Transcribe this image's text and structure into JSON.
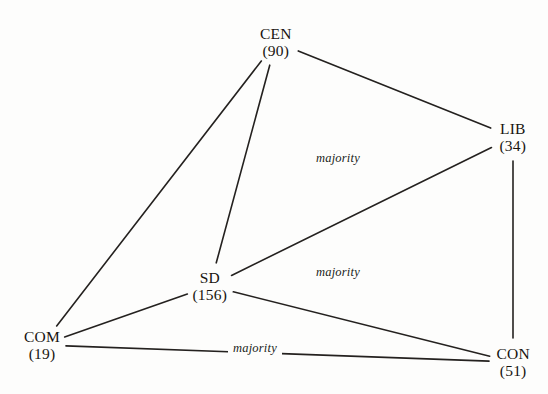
{
  "diagram": {
    "type": "coalition-graph",
    "background_color": "#fdfdfc",
    "line_color": "#24211f",
    "text_color": "#17140f",
    "nodes": [
      {
        "id": "CEN",
        "name": "CEN",
        "count": "(90)",
        "value": 90,
        "x": 276,
        "y": 42
      },
      {
        "id": "LIB",
        "name": "LIB",
        "count": "(34)",
        "value": 34,
        "x": 513,
        "y": 137
      },
      {
        "id": "SD",
        "name": "SD",
        "count": "(156)",
        "value": 156,
        "x": 210,
        "y": 286
      },
      {
        "id": "COM",
        "name": "COM",
        "count": "(19)",
        "value": 19,
        "x": 42,
        "y": 345
      },
      {
        "id": "CON",
        "name": "CON",
        "count": "(51)",
        "value": 51,
        "x": 513,
        "y": 362
      }
    ],
    "edges": [
      {
        "id": "cen-lib",
        "from": "CEN",
        "to": "LIB"
      },
      {
        "id": "cen-com",
        "from": "CEN",
        "to": "COM"
      },
      {
        "id": "cen-sd",
        "from": "CEN",
        "to": "SD"
      },
      {
        "id": "lib-sd",
        "from": "LIB",
        "to": "SD"
      },
      {
        "id": "lib-con",
        "from": "LIB",
        "to": "CON"
      },
      {
        "id": "sd-com",
        "from": "SD",
        "to": "COM"
      },
      {
        "id": "sd-con",
        "from": "SD",
        "to": "CON"
      },
      {
        "id": "com-con",
        "from": "COM",
        "to": "CON"
      }
    ],
    "annotations": [
      {
        "id": "majority-upper",
        "label": "majority",
        "x": 338,
        "y": 158,
        "on_edge": false
      },
      {
        "id": "majority-middle",
        "label": "majority",
        "x": 338,
        "y": 272,
        "on_edge": false
      },
      {
        "id": "majority-bottom",
        "label": "majority",
        "x": 255,
        "y": 348,
        "on_edge": true
      }
    ]
  }
}
